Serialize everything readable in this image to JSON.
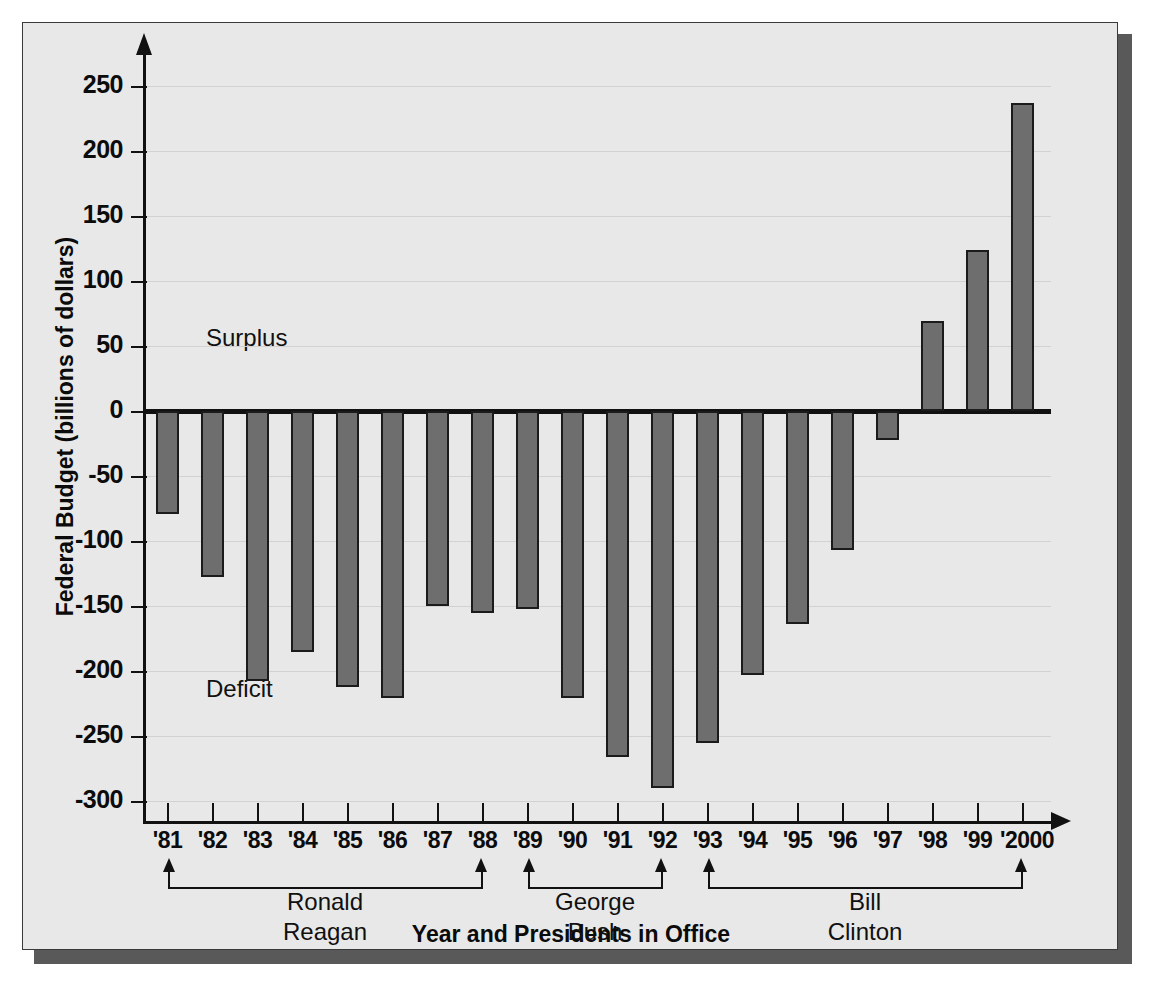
{
  "chart_data": {
    "type": "bar",
    "title": "",
    "xlabel": "Year and Presidents in Office",
    "ylabel": "Federal Budget (billions of dollars)",
    "categories": [
      "'81",
      "'82",
      "'83",
      "'84",
      "'85",
      "'86",
      "'87",
      "'88",
      "'89",
      "'90",
      "'91",
      "'92",
      "'93",
      "'94",
      "'95",
      "'96",
      "'97",
      "'98",
      "'99",
      "'2000"
    ],
    "values": [
      -79,
      -128,
      -208,
      -185,
      -212,
      -221,
      -150,
      -155,
      -152,
      -221,
      -266,
      -290,
      -255,
      -203,
      -164,
      -107,
      -22,
      69,
      124,
      237
    ],
    "ylim": [
      -300,
      270
    ],
    "yticks": [
      250,
      200,
      150,
      100,
      50,
      0,
      -50,
      -100,
      -150,
      -200,
      -250,
      -300
    ],
    "ytick_labels": [
      "250",
      "200",
      "150",
      "100",
      "50",
      "0",
      "-50",
      "-100",
      "-150",
      "-200",
      "-250",
      "-300"
    ],
    "grid": true,
    "legend": "none",
    "annotations": [
      {
        "text": "Surplus",
        "value_hint": 55
      },
      {
        "text": "Deficit",
        "value_hint": -215
      }
    ],
    "groups": [
      {
        "name": "Ronald\nReagan",
        "start_category": "'81",
        "end_category": "'88"
      },
      {
        "name": "George\nBush",
        "start_category": "'89",
        "end_category": "'92"
      },
      {
        "name": "Bill\nClinton",
        "start_category": "'93",
        "end_category": "'2000"
      }
    ]
  },
  "colors": {
    "bar_fill": "#6e6e6e",
    "bar_stroke": "#1b1b1b",
    "panel_background": "#e8e8e8",
    "panel_border": "#3a3a3a",
    "shadow": "#595959",
    "axis": "#111111",
    "gridline": "#d2d2d2"
  },
  "annotations": {
    "surplus": "Surplus",
    "deficit": "Deficit"
  },
  "axes": {
    "y_title": "Federal Budget (billions of dollars)",
    "x_title": "Year and Presidents in Office"
  },
  "presidents": [
    {
      "label": "Ronald\nReagan"
    },
    {
      "label": "George\nBush"
    },
    {
      "label": "Bill\nClinton"
    }
  ]
}
